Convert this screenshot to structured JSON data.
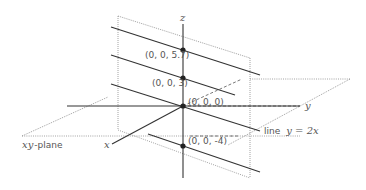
{
  "diagram": {
    "type": "3d-coordinate-illustration",
    "axes": {
      "x_label": "x",
      "y_label": "y",
      "z_label": "z"
    },
    "points": [
      {
        "label": "(0, 0, 5.7)"
      },
      {
        "label": "(0, 0, 3)"
      },
      {
        "label": "(0, 0, 0)"
      },
      {
        "label": "(0, 0, -4)"
      }
    ],
    "plane_label_var": "xy",
    "plane_label_suffix": "-plane",
    "line_label_prefix": "line",
    "line_label_eq": "y = 2x",
    "colors": {
      "line": "#333333",
      "dotted": "#888888",
      "text": "#555555"
    }
  }
}
